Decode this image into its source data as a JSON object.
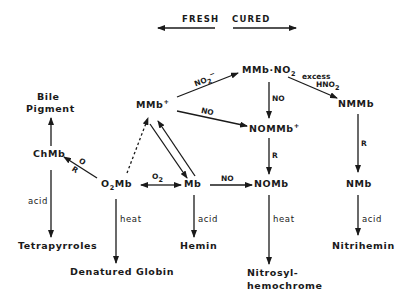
{
  "header": {
    "fresh_label": "FRESH",
    "cured_label": "CURED"
  },
  "nodes": {
    "mmb_plus": "MMb",
    "mmb_plus_sup": "+",
    "mmb_no2": "MMb·NO",
    "mmb_no2_sub": "2",
    "nmmb": "NMMb",
    "nommb_plus": "NOMMb",
    "nommb_plus_sup": "+",
    "bile_pigment_line1": "Bile",
    "bile_pigment_line2": "Pigment",
    "chmb": "ChMb",
    "o2mb_prefix": "O",
    "o2mb_sub": "2",
    "o2mb_suffix": "Mb",
    "mb": "Mb",
    "nomb": "NOMb",
    "nmb": "NMb",
    "tetrapyrroles": "Tetrapyrroles",
    "denatured_line1": "Denatured Globin",
    "denatured_line2": "Hemichrome",
    "hemin": "Hemin",
    "nitrosyl_line1": "Nitrosyl-",
    "nitrosyl_line2": "hemochrome",
    "nitrihemin": "Nitrihemin"
  },
  "edge_labels": {
    "no2_minus": "NO",
    "no2_minus_sub": "2",
    "no2_minus_sup": "−",
    "no_mmb_to_nommb": "NO",
    "no_mmbno2_to_nommb": "NO",
    "excess": "excess",
    "hno2": "HNO",
    "hno2_sub": "2",
    "r_nmmb_to_nmb": "R",
    "r_nommb_to_nomb": "R",
    "o_label": "O",
    "r_label": "R",
    "o2_label": "O",
    "o2_label_sub": "2",
    "no_mb_to_nomb": "NO",
    "acid_chmb": "acid",
    "heat_o2mb": "heat",
    "acid_mb": "acid",
    "heat_nomb": "heat",
    "acid_nmb": "acid"
  }
}
